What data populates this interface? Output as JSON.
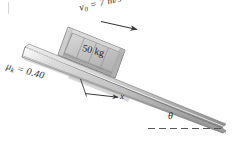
{
  "figure": {
    "background_color": "#ffffff",
    "width": 238,
    "height": 144
  },
  "labels": {
    "initial_velocity_symbol": "v",
    "initial_velocity_subscript": "0",
    "initial_velocity_value": " = 7 m/s",
    "friction_symbol": "μ",
    "friction_subscript": "k",
    "friction_value": " = 0.40",
    "mass": "50 kg",
    "axis_x": "x",
    "angle": "θ"
  },
  "colors": {
    "incline_fill": "#c9c9c9",
    "incline_edge": "#6e6e6e",
    "crate_fill": "#c4c4c4",
    "crate_frame": "#b0b0b0",
    "crate_line": "#737373",
    "text": "#2b2b2b",
    "arrow": "#3a3a3a",
    "dashed_line": "#555555"
  },
  "elements": {
    "incline_name": "inclined-ramp",
    "crate_name": "crate-50kg",
    "velocity_arrow_name": "velocity-arrow",
    "x_axis_arrow_name": "x-axis-arrow",
    "angle_dashed_line_name": "horizontal-reference-dashed-line"
  }
}
